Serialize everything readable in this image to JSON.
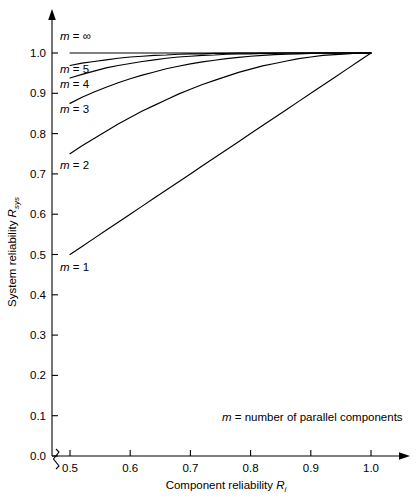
{
  "chart_data": {
    "type": "line",
    "title": "",
    "xlabel": "Component reliability R",
    "xlabel_sub": "i",
    "ylabel": "System reliability R",
    "ylabel_sub": "sys",
    "xlim": [
      0.5,
      1.0
    ],
    "ylim": [
      0.0,
      1.0
    ],
    "x_ticks": [
      "0.5",
      "0.6",
      "0.7",
      "0.8",
      "0.9",
      "1.0"
    ],
    "x_tick_values": [
      0.5,
      0.6,
      0.7,
      0.8,
      0.9,
      1.0
    ],
    "y_ticks": [
      "0.0",
      "0.1",
      "0.2",
      "0.3",
      "0.4",
      "0.5",
      "0.6",
      "0.7",
      "0.8",
      "0.9",
      "1.0"
    ],
    "y_tick_values": [
      0.0,
      0.1,
      0.2,
      0.3,
      0.4,
      0.5,
      0.6,
      0.7,
      0.8,
      0.9,
      1.0
    ],
    "grid": false,
    "legend": "inline-labels",
    "axis_break": "y-axis broken between 0.0 and 0.5 on x-axis",
    "annotation": "m = number of parallel components",
    "formula": "R_sys = 1 - (1 - R_i)^m",
    "x": [
      0.5,
      0.52,
      0.54,
      0.56,
      0.58,
      0.6,
      0.62,
      0.64,
      0.66,
      0.68,
      0.7,
      0.72,
      0.74,
      0.76,
      0.78,
      0.8,
      0.82,
      0.84,
      0.86,
      0.88,
      0.9,
      0.92,
      0.94,
      0.96,
      0.98,
      1.0
    ],
    "series": [
      {
        "name": "m = 1",
        "label": "m = 1",
        "m": 1,
        "values": [
          0.5,
          0.52,
          0.54,
          0.56,
          0.58,
          0.6,
          0.62,
          0.64,
          0.66,
          0.68,
          0.7,
          0.72,
          0.74,
          0.76,
          0.78,
          0.8,
          0.82,
          0.84,
          0.86,
          0.88,
          0.9,
          0.92,
          0.94,
          0.96,
          0.98,
          1.0
        ]
      },
      {
        "name": "m = 2",
        "label": "m = 2",
        "m": 2,
        "values": [
          0.75,
          0.77,
          0.788,
          0.806,
          0.824,
          0.84,
          0.856,
          0.87,
          0.884,
          0.898,
          0.91,
          0.922,
          0.932,
          0.942,
          0.952,
          0.96,
          0.968,
          0.974,
          0.98,
          0.986,
          0.99,
          0.994,
          0.996,
          0.998,
          1.0,
          1.0
        ]
      },
      {
        "name": "m = 3",
        "label": "m = 3",
        "m": 3,
        "values": [
          0.875,
          0.89,
          0.903,
          0.915,
          0.926,
          0.936,
          0.945,
          0.953,
          0.961,
          0.967,
          0.973,
          0.978,
          0.982,
          0.986,
          0.989,
          0.992,
          0.994,
          0.996,
          0.997,
          0.998,
          0.999,
          1.0,
          1.0,
          1.0,
          1.0,
          1.0
        ]
      },
      {
        "name": "m = 4",
        "label": "m = 4",
        "m": 4,
        "values": [
          0.938,
          0.947,
          0.955,
          0.963,
          0.969,
          0.974,
          0.979,
          0.983,
          0.987,
          0.99,
          0.992,
          0.994,
          0.995,
          0.997,
          0.998,
          0.998,
          0.999,
          0.999,
          1.0,
          1.0,
          1.0,
          1.0,
          1.0,
          1.0,
          1.0,
          1.0
        ]
      },
      {
        "name": "m = 5",
        "label": "m = 5",
        "m": 5,
        "values": [
          0.969,
          0.975,
          0.979,
          0.983,
          0.987,
          0.99,
          0.992,
          0.994,
          0.995,
          0.997,
          0.998,
          0.998,
          0.999,
          0.999,
          1.0,
          1.0,
          1.0,
          1.0,
          1.0,
          1.0,
          1.0,
          1.0,
          1.0,
          1.0,
          1.0,
          1.0
        ]
      },
      {
        "name": "m = infinity",
        "label": "m = ∞",
        "m": "∞",
        "values": [
          1.0,
          1.0,
          1.0,
          1.0,
          1.0,
          1.0,
          1.0,
          1.0,
          1.0,
          1.0,
          1.0,
          1.0,
          1.0,
          1.0,
          1.0,
          1.0,
          1.0,
          1.0,
          1.0,
          1.0,
          1.0,
          1.0,
          1.0,
          1.0,
          1.0,
          1.0
        ]
      }
    ],
    "series_label_positions": [
      {
        "label": "m = ∞",
        "x_px": 60,
        "y_px": 40
      },
      {
        "label": "m = 5",
        "x_px": 60,
        "y_px": 73
      },
      {
        "label": "m = 4",
        "x_px": 60,
        "y_px": 88
      },
      {
        "label": "m = 3",
        "x_px": 60,
        "y_px": 113
      },
      {
        "label": "m = 2",
        "x_px": 60,
        "y_px": 169
      },
      {
        "label": "m = 1",
        "x_px": 60,
        "y_px": 271
      }
    ],
    "annotation_position": {
      "x_px": 222,
      "y_px": 421
    }
  },
  "colors": {
    "background": "#ffffff",
    "axis": "#000000",
    "curve": "#000000",
    "text": "#000000"
  }
}
